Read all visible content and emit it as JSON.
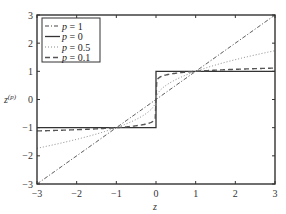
{
  "chart_data": {
    "type": "line",
    "title": "",
    "xlabel": "z",
    "ylabel": "z^(p)",
    "xlim": [
      -3,
      3
    ],
    "ylim": [
      -3,
      3
    ],
    "xticks": [
      -3,
      -2,
      -1,
      0,
      1,
      2,
      3
    ],
    "yticks": [
      -3,
      -2,
      -1,
      0,
      1,
      2,
      3
    ],
    "xtick_labels": [
      "−3",
      "−2",
      "−1",
      "0",
      "1",
      "2",
      "3"
    ],
    "ytick_labels": [
      "−3",
      "−2",
      "−1",
      "0",
      "1",
      "2",
      "3"
    ],
    "grid": false,
    "legend_position": "upper left",
    "x": [
      -3,
      -2.5,
      -2,
      -1.5,
      -1,
      -0.5,
      -0.25,
      -0.1,
      -0.01,
      0,
      0.01,
      0.1,
      0.25,
      0.5,
      1,
      1.5,
      2,
      2.5,
      3
    ],
    "series": [
      {
        "name": "p = 1",
        "style": "dash-dot",
        "color": "#444444",
        "values": [
          -3,
          -2.5,
          -2,
          -1.5,
          -1,
          -0.5,
          -0.25,
          -0.1,
          -0.01,
          0,
          0.01,
          0.1,
          0.25,
          0.5,
          1,
          1.5,
          2,
          2.5,
          3
        ]
      },
      {
        "name": "p = 0",
        "style": "solid",
        "color": "#333333",
        "values": [
          -1,
          -1,
          -1,
          -1,
          -1,
          -1,
          -1,
          -1,
          -1,
          0,
          1,
          1,
          1,
          1,
          1,
          1,
          1,
          1,
          1
        ]
      },
      {
        "name": "p = 0.5",
        "style": "dotted",
        "color": "#888888",
        "values": [
          -1.732,
          -1.581,
          -1.414,
          -1.225,
          -1,
          -0.707,
          -0.5,
          -0.316,
          -0.1,
          0,
          0.1,
          0.316,
          0.5,
          0.707,
          1,
          1.225,
          1.414,
          1.581,
          1.732
        ]
      },
      {
        "name": "p = 0.1",
        "style": "dashed",
        "color": "#555555",
        "values": [
          -1.116,
          -1.096,
          -1.072,
          -1.041,
          -1,
          -0.933,
          -0.871,
          -0.794,
          -0.631,
          0,
          0.631,
          0.794,
          0.871,
          0.933,
          1,
          1.041,
          1.072,
          1.096,
          1.116
        ]
      }
    ]
  },
  "legend": {
    "items": [
      {
        "var": "p",
        "eq": " = 1"
      },
      {
        "var": "p",
        "eq": " = 0"
      },
      {
        "var": "p",
        "eq": " = 0.5"
      },
      {
        "var": "p",
        "eq": " = 0.1"
      }
    ]
  },
  "axes": {
    "xlabel": "z",
    "ylabel_base": "z",
    "ylabel_sup": "(p)"
  }
}
